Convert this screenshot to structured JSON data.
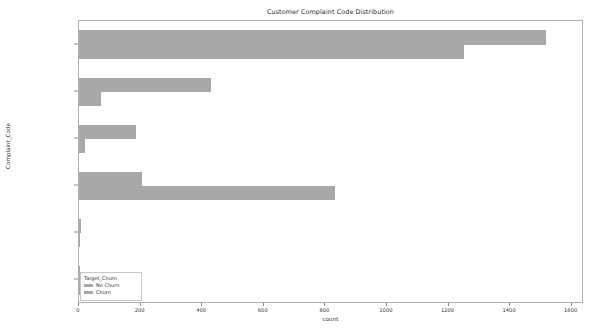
{
  "chart_data": {
    "type": "bar",
    "orientation": "horizontal",
    "title": "Customer Complaint Code Distribution",
    "xlabel": "count",
    "ylabel": "Complaint_Code",
    "categories": [
      "Billing Problem",
      "Moving",
      "Check Account",
      "Call Quality",
      "Inaccurate Sales Inf",
      "Pricing"
    ],
    "series": [
      {
        "name": "No Churn",
        "color": "#a8a8a8",
        "values": [
          1515,
          430,
          185,
          205,
          8,
          3
        ]
      },
      {
        "name": "Churn",
        "color": "#a8a8a8",
        "values": [
          1250,
          70,
          18,
          830,
          3,
          1
        ]
      }
    ],
    "xlim": [
      0,
      1640
    ],
    "xticks": [
      0,
      200,
      400,
      600,
      800,
      1000,
      1200,
      1400,
      1600
    ],
    "xtick_labels": [
      "0",
      "200",
      "400",
      "600",
      "800",
      "1000",
      "1200",
      "1400",
      "1600"
    ],
    "grid": false,
    "legend": {
      "title": "Target_Churn",
      "position": "lower-left",
      "entries": [
        "No Churn",
        "Churn"
      ]
    }
  }
}
